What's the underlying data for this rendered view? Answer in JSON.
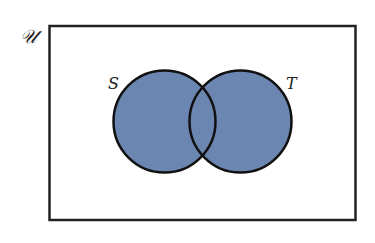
{
  "diagram": {
    "type": "venn",
    "universe_label": "𝒰",
    "sets": [
      {
        "label": "S",
        "shaded": true
      },
      {
        "label": "T",
        "shaded": true
      }
    ],
    "shaded_region": "S ∪ T",
    "colors": {
      "fill": "#6c86b2",
      "stroke": "#1a1a1a",
      "background": "#ffffff"
    }
  }
}
